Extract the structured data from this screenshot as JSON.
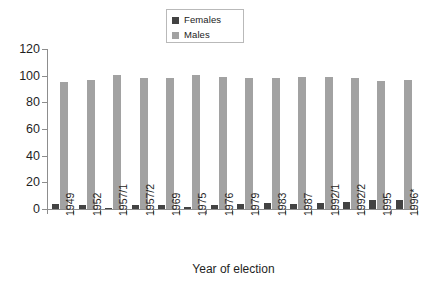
{
  "chart_data": {
    "type": "bar",
    "title": "",
    "subtitle": "",
    "xlabel": "Year of election",
    "ylabel": "",
    "ylim": [
      0,
      120
    ],
    "yticks": [
      0,
      20,
      40,
      60,
      80,
      100,
      120
    ],
    "grid": false,
    "legend_position": "top-center",
    "categories": [
      "1949",
      "1952",
      "1957/1",
      "1957/2",
      "1969",
      "1975",
      "1976",
      "1979",
      "1983",
      "1987",
      "1992/1",
      "1992/2",
      "1995",
      "1996*"
    ],
    "series": [
      {
        "name": "Females",
        "color": "#434343",
        "values": [
          4.0,
          2.7,
          0.7,
          3.1,
          3.0,
          1.6,
          2.8,
          3.4,
          4.4,
          4.0,
          4.6,
          5.2,
          6.8,
          6.7
        ]
      },
      {
        "name": "Males",
        "color": "#a2a2a2",
        "values": [
          95.5,
          97.0,
          100.3,
          98.6,
          98.6,
          100.2,
          99.0,
          98.5,
          98.6,
          99.3,
          98.8,
          98.4,
          96.3,
          97.0
        ]
      }
    ]
  },
  "legend": {
    "items": [
      {
        "label": "Females",
        "color": "#434343"
      },
      {
        "label": "Males",
        "color": "#a2a2a2"
      }
    ]
  },
  "axes": {
    "x_title": "Year of election",
    "y_tick_labels": [
      "0",
      "20",
      "40",
      "60",
      "80",
      "100",
      "120"
    ]
  }
}
